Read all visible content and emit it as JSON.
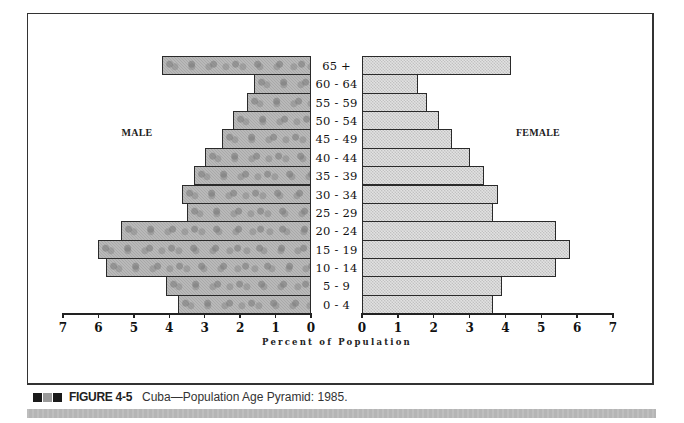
{
  "chart_data": {
    "type": "bar",
    "subtype": "population-pyramid",
    "title": "Cuba—Population Age Pyramid: 1985.",
    "xlabel": "Percent of Population",
    "ylabel": "",
    "categories": [
      "65 +",
      "60 - 64",
      "55 - 59",
      "50 - 54",
      "45 - 49",
      "40 - 44",
      "35 - 39",
      "30 - 34",
      "25 - 29",
      "20 - 24",
      "15 - 19",
      "10 - 14",
      "5 - 9",
      "0 - 4"
    ],
    "series": [
      {
        "name": "MALE",
        "side": "left",
        "color": "#a9a9a9",
        "values": [
          4.2,
          1.6,
          1.8,
          2.2,
          2.5,
          3.0,
          3.3,
          3.65,
          3.5,
          5.35,
          6.0,
          5.8,
          4.1,
          3.75
        ]
      },
      {
        "name": "FEMALE",
        "side": "right",
        "color": "#d3d3d3",
        "values": [
          4.15,
          1.55,
          1.8,
          2.15,
          2.5,
          3.0,
          3.4,
          3.8,
          3.65,
          5.4,
          5.8,
          5.4,
          3.9,
          3.65
        ]
      }
    ],
    "xlim": [
      0,
      7
    ],
    "xticks": [
      0,
      1,
      2,
      3,
      4,
      5,
      6,
      7
    ],
    "grid": false,
    "legend": "side labels (MALE left, FEMALE right)"
  },
  "labels": {
    "male": "MALE",
    "female": "FEMALE",
    "xaxis": "Percent of Population"
  },
  "caption": {
    "figure_number": "FIGURE 4-5",
    "text": "Cuba—Population Age Pyramid: 1985."
  },
  "colors": {
    "male_bar": "#a9a9a9",
    "female_bar": "#d3d3d3",
    "caption_squares": [
      "#1a1a1a",
      "#9a9a9a",
      "#1a1a1a"
    ],
    "band": "#b5b5b5"
  }
}
